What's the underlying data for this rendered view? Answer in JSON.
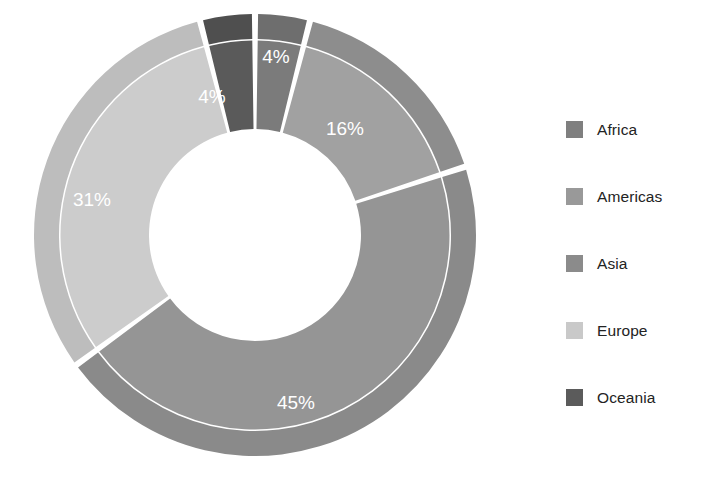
{
  "chart_data": {
    "type": "pie",
    "variant": "donut",
    "title": "",
    "subtitle": "",
    "xlabel": "",
    "ylabel": "",
    "grid": false,
    "legend_position": "right",
    "start_angle_deg": 0,
    "direction": "clockwise",
    "categories": [
      "Africa",
      "Americas",
      "Asia",
      "Europe",
      "Oceania"
    ],
    "values": [
      4,
      16,
      45,
      31,
      4
    ],
    "value_unit": "%",
    "data_labels": [
      "4%",
      "16%",
      "45%",
      "31%",
      "4%"
    ],
    "slices": [
      {
        "name": "Africa",
        "value": 4,
        "label": "4%",
        "ring_color": "#6e6e6e",
        "fill_color": "#7b7b7b",
        "label_x": 276,
        "label_y": 58
      },
      {
        "name": "Americas",
        "value": 16,
        "label": "16%",
        "ring_color": "#8d8d8d",
        "fill_color": "#a1a1a1",
        "label_x": 345,
        "label_y": 130
      },
      {
        "name": "Asia",
        "value": 45,
        "label": "45%",
        "ring_color": "#8a8a8a",
        "fill_color": "#959595",
        "label_x": 296,
        "label_y": 404
      },
      {
        "name": "Europe",
        "value": 31,
        "label": "31%",
        "ring_color": "#bdbdbd",
        "fill_color": "#cccccc",
        "label_x": 92,
        "label_y": 201
      },
      {
        "name": "Oceania",
        "value": 4,
        "label": "4%",
        "ring_color": "#4f4f4f",
        "fill_color": "#5a5a5a",
        "label_x": 212,
        "label_y": 98
      }
    ],
    "geometry": {
      "center_x": 255,
      "center_y": 235,
      "outer_radius": 221,
      "ring_inner_radius": 196,
      "hole_radius": 106
    }
  },
  "legend": {
    "items": [
      {
        "label": "Africa",
        "color": "#7f7f7f"
      },
      {
        "label": "Americas",
        "color": "#999999"
      },
      {
        "label": "Asia",
        "color": "#8b8b8b"
      },
      {
        "label": "Europe",
        "color": "#c9c9c9"
      },
      {
        "label": "Oceania",
        "color": "#5b5b5b"
      }
    ]
  },
  "label_text_color": "#ffffff",
  "background_color": "#ffffff"
}
